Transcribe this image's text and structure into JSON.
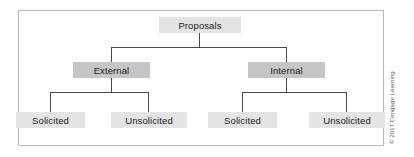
{
  "figure": {
    "credit": "© 2017 Cengage Learning",
    "colors": {
      "root_fill": "#e4e4e4",
      "mid_fill": "#c6c6c6",
      "leaf_fill": "#e4e4e4",
      "line": "#4a4a4a",
      "frame_border": "#bcbcbc",
      "background": "#ffffff",
      "text": "#1b1b1b"
    }
  },
  "tree": {
    "root": {
      "label": "Proposals"
    },
    "branches": [
      {
        "label": "External",
        "children": [
          {
            "label": "Solicited"
          },
          {
            "label": "Unsolicited"
          }
        ]
      },
      {
        "label": "Internal",
        "children": [
          {
            "label": "Solicited"
          },
          {
            "label": "Unsolicited"
          }
        ]
      }
    ]
  }
}
